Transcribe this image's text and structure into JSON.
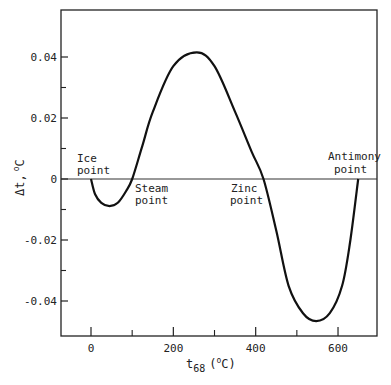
{
  "chart_data": {
    "type": "line",
    "title": "",
    "xlabel": "t68 (°C)",
    "xlabel_main": "t",
    "xlabel_sub": "68",
    "xlabel_unit_open": "(",
    "xlabel_unit_deg": "o",
    "xlabel_unit_c": "C)",
    "ylabel": "Δt, °C",
    "ylabel_main": "Δt,",
    "ylabel_deg": "o",
    "ylabel_c": "C",
    "xlim": [
      -45,
      695
    ],
    "ylim": [
      -0.0515,
      0.055
    ],
    "x_ticks_major": [
      0,
      200,
      400,
      600
    ],
    "x_tick_labels": [
      "0",
      "200",
      "400",
      "600"
    ],
    "x_ticks_minor": [
      100,
      300,
      500
    ],
    "y_ticks_major": [
      0.04,
      0.02,
      0,
      -0.02,
      -0.04
    ],
    "y_tick_labels": [
      "0.04",
      "0.02",
      "0",
      "-0.02",
      "-0.04"
    ],
    "y_ticks_minor": [
      0.03,
      0.01,
      -0.01,
      -0.03
    ],
    "grid": false,
    "zero_line": true,
    "series": [
      {
        "name": "Δt",
        "x": [
          0,
          10,
          25,
          45,
          65,
          85,
          100,
          125,
          150,
          200,
          257,
          300,
          350,
          390,
          419,
          450,
          480,
          515,
          547,
          580,
          610,
          630,
          649
        ],
        "y": [
          0,
          -0.005,
          -0.0078,
          -0.0089,
          -0.0078,
          -0.004,
          0,
          0.011,
          0.022,
          0.037,
          0.0415,
          0.037,
          0.022,
          0.009,
          0,
          -0.017,
          -0.035,
          -0.044,
          -0.0466,
          -0.044,
          -0.035,
          -0.02,
          0
        ]
      }
    ],
    "annotations": [
      {
        "text_line1": "Ice",
        "text_line2": "point",
        "x": 0,
        "y": 0
      },
      {
        "text_line1": "Steam",
        "text_line2": "point",
        "x": 100,
        "y": 0
      },
      {
        "text_line1": "Zinc",
        "text_line2": "point",
        "x": 419.58,
        "y": 0
      },
      {
        "text_line1": "Antimony",
        "text_line2": "point",
        "x": 630.74,
        "y": 0
      }
    ]
  }
}
